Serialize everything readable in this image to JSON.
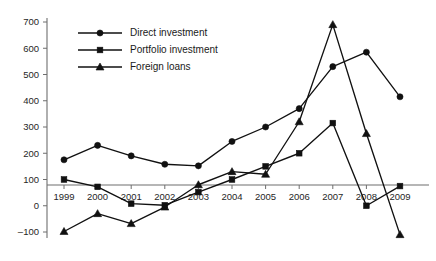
{
  "chart_data": {
    "type": "line",
    "title": "",
    "subtitle": "",
    "xlabel": "",
    "ylabel": "",
    "categories": [
      "1999",
      "2000",
      "2001",
      "2002",
      "2003",
      "2004",
      "2005",
      "2006",
      "2007",
      "2008",
      "2009"
    ],
    "x": [
      1999,
      2000,
      2001,
      2002,
      2003,
      2004,
      2005,
      2006,
      2007,
      2008,
      2009
    ],
    "xlim": [
      1999,
      2009
    ],
    "ylim": [
      -100,
      700
    ],
    "yticks": [
      -100,
      0,
      100,
      200,
      300,
      400,
      500,
      600,
      700
    ],
    "ytick_labels": [
      "–100",
      "0",
      "100",
      "200",
      "300",
      "400",
      "500",
      "600",
      "700"
    ],
    "grid": false,
    "legend_position": "top-left",
    "series": [
      {
        "name": "Direct investment",
        "marker": "circle",
        "values": [
          175,
          230,
          190,
          158,
          152,
          245,
          300,
          370,
          530,
          585,
          415
        ]
      },
      {
        "name": "Portfolio investment",
        "marker": "square",
        "values": [
          100,
          72,
          8,
          2,
          52,
          100,
          150,
          200,
          315,
          0,
          75
        ]
      },
      {
        "name": "Foreign loans",
        "marker": "triangle",
        "values": [
          -98,
          -30,
          -68,
          -5,
          80,
          130,
          120,
          320,
          690,
          275,
          -110
        ]
      }
    ]
  },
  "legend": {
    "items": [
      {
        "label": "Direct investment",
        "marker": "circle"
      },
      {
        "label": "Portfolio investment",
        "marker": "square"
      },
      {
        "label": "Foreign loans",
        "marker": "triangle"
      }
    ]
  }
}
